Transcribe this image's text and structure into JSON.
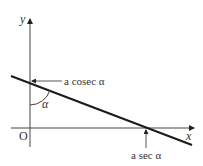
{
  "diagram": {
    "axes": {
      "x_label": "x",
      "y_label": "y",
      "origin_label": "O"
    },
    "line": {
      "description": "straight line with negative gradient crossing both axes"
    },
    "annotations": {
      "y_intercept_label": "a cosec α",
      "x_intercept_label": "a sec α",
      "angle_label": "α"
    },
    "colors": {
      "stroke": "#1a1a1a",
      "text": "#333333",
      "background": "#ffffff"
    }
  }
}
